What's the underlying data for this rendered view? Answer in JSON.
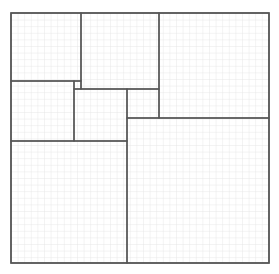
{
  "diagram": {
    "type": "rectangle-dissection-on-grid-paper",
    "canvas": {
      "width": 279,
      "height": 274
    },
    "colors": {
      "background": "#ffffff",
      "grid": "#e2e2e2",
      "stroke": "#555555"
    },
    "grid": {
      "x0": 11,
      "y0": 13,
      "spacing": 6.6
    },
    "outer": {
      "x": 11,
      "y": 13,
      "w": 258,
      "h": 250
    },
    "regions": [
      {
        "id": "A",
        "x": 11,
        "y": 13,
        "w": 70,
        "h": 68
      },
      {
        "id": "B",
        "x": 81,
        "y": 13,
        "w": 78,
        "h": 76
      },
      {
        "id": "C",
        "x": 159,
        "y": 13,
        "w": 110,
        "h": 105
      },
      {
        "id": "D",
        "x": 11,
        "y": 81,
        "w": 63,
        "h": 60
      },
      {
        "id": "gap",
        "x": 74,
        "y": 81,
        "w": 7,
        "h": 8
      },
      {
        "id": "E",
        "x": 74,
        "y": 89,
        "w": 53,
        "h": 52
      },
      {
        "id": "F",
        "x": 127,
        "y": 89,
        "w": 32,
        "h": 29
      },
      {
        "id": "G",
        "x": 11,
        "y": 141,
        "w": 116,
        "h": 122
      },
      {
        "id": "H",
        "x": 127,
        "y": 118,
        "w": 142,
        "h": 145
      }
    ]
  }
}
